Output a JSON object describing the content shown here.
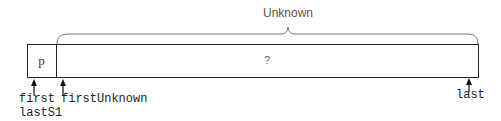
{
  "diagram": {
    "brace_label": "Unknown",
    "cells": [
      {
        "id": "p",
        "label": "p"
      },
      {
        "id": "unknown",
        "label": "?"
      }
    ],
    "pointers": [
      {
        "id": "first",
        "label": "first"
      },
      {
        "id": "lastS1",
        "label": "lastS1"
      },
      {
        "id": "firstUnknown",
        "label": "firstUnknown"
      },
      {
        "id": "last",
        "label": "last"
      }
    ]
  }
}
